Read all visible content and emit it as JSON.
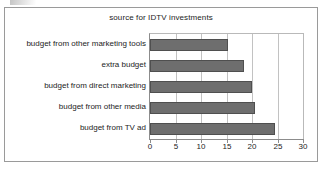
{
  "chart_data": {
    "type": "bar",
    "orientation": "horizontal",
    "title": "source for IDTV investments",
    "xlabel": "",
    "ylabel": "",
    "categories": [
      "budget from other marketing tools",
      "extra budget",
      "budget from direct marketing",
      "budget from other media",
      "budget from TV ad"
    ],
    "values": [
      15.2,
      18.4,
      20.0,
      20.5,
      24.5
    ],
    "xlim": [
      0,
      30
    ],
    "xticks": [
      0,
      5,
      10,
      15,
      20,
      25,
      30
    ],
    "xtick_labels": [
      "0",
      "5",
      "10",
      "15",
      "20",
      "25",
      "30"
    ],
    "grid": true,
    "legend": false,
    "bar_color": "#6e6e6e",
    "bar_border_color": "#4f4f4f",
    "frame_color": "#9a9a9a",
    "axis_color": "#8c8c8c",
    "grid_color": "#c2c2c2",
    "text_color": "#1c1c1c"
  }
}
